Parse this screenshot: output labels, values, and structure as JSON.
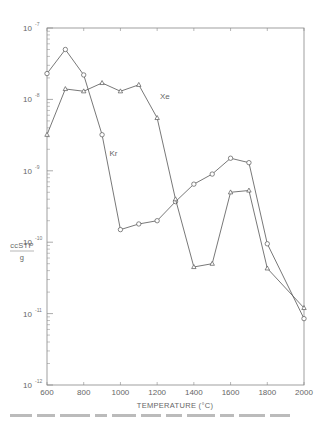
{
  "chart_data": {
    "type": "line",
    "title": "",
    "xlabel": "TEMPERATURE (°C)",
    "ylabel": "ccSTP / g",
    "ylabel_numerator": "ccSTP",
    "ylabel_denominator": "g",
    "yscale": "log",
    "xlim": [
      600,
      2000
    ],
    "ylim": [
      1e-12,
      1e-07
    ],
    "grid": false,
    "legend": "inline labels",
    "x_ticks": [
      600,
      800,
      1000,
      1200,
      1400,
      1600,
      1800,
      2000
    ],
    "x_tick_labels": [
      "600",
      "800",
      "1000",
      "1200",
      "1400",
      "1600",
      "1800",
      "2000"
    ],
    "y_ticks": [
      {
        "base": "10",
        "exp": "-7",
        "value": 1e-07
      },
      {
        "base": "10",
        "exp": "-8",
        "value": 1e-08
      },
      {
        "base": "10",
        "exp": "-9",
        "value": 1e-09
      },
      {
        "base": "10",
        "exp": "-10",
        "value": 1e-10
      },
      {
        "base": "10",
        "exp": "-11",
        "value": 1e-11
      },
      {
        "base": "10",
        "exp": "-12",
        "value": 1e-12
      }
    ],
    "x": [
      600,
      700,
      800,
      900,
      1000,
      1100,
      1200,
      1300,
      1400,
      1500,
      1600,
      1700,
      1800,
      2000
    ],
    "series": [
      {
        "name": "Kr",
        "marker": "circle",
        "label_pos": {
          "x": 940,
          "y": 1.6e-09
        },
        "values": [
          2.3e-08,
          5e-08,
          2.2e-08,
          3.2e-09,
          1.5e-10,
          1.8e-10,
          2e-10,
          3.7e-10,
          6.5e-10,
          9e-10,
          1.5e-09,
          1.3e-09,
          9.5e-11,
          8.5e-12
        ]
      },
      {
        "name": "Xe",
        "marker": "triangle",
        "label_pos": {
          "x": 1215,
          "y": 1e-08
        },
        "values": [
          3.2e-09,
          1.4e-08,
          1.3e-08,
          1.7e-08,
          1.3e-08,
          1.6e-08,
          5.5e-09,
          4e-10,
          4.5e-11,
          5e-11,
          5e-10,
          5.3e-10,
          4.3e-11,
          1.2e-11
        ]
      }
    ]
  },
  "colors": {
    "line": "#555555",
    "axis": "#888888",
    "background": "#ffffff"
  }
}
